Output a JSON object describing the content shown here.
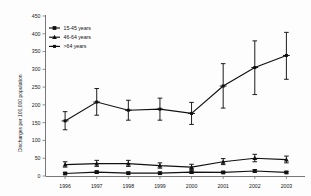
{
  "chart_data": {
    "type": "line",
    "title": "",
    "subtitle": "",
    "xlabel": "",
    "ylabel": "Discharges per 100,000 population",
    "categories": [
      "1996",
      "1997",
      "1998",
      "1999",
      "2000",
      "2001",
      "2002",
      "2003"
    ],
    "x": [
      1996,
      1997,
      1998,
      1999,
      2000,
      2001,
      2002,
      2003
    ],
    "ylim": [
      0,
      450
    ],
    "yticks": [
      0,
      50,
      100,
      150,
      200,
      250,
      300,
      350,
      400,
      450
    ],
    "ytick_labels": [
      "0",
      "50",
      "100",
      "150",
      "200",
      "250",
      "300",
      "350",
      "400",
      "450"
    ],
    "grid": false,
    "legend_position": "top-left",
    "error_bars": true,
    "error_bar_type": "95% confidence interval",
    "series": [
      {
        "name": "15-45 years",
        "marker": "square",
        "color": "#111111",
        "values": [
          7,
          11,
          8,
          8,
          11,
          10,
          14,
          10
        ],
        "err_low": [
          5,
          8,
          6,
          6,
          8,
          8,
          11,
          8
        ],
        "err_high": [
          10,
          14,
          11,
          11,
          14,
          13,
          18,
          13
        ]
      },
      {
        "name": "46-64 years",
        "marker": "triangle",
        "color": "#111111",
        "values": [
          32,
          35,
          35,
          29,
          25,
          40,
          50,
          46
        ],
        "err_low": [
          25,
          27,
          27,
          22,
          18,
          32,
          40,
          37
        ],
        "err_high": [
          40,
          44,
          44,
          37,
          33,
          49,
          61,
          56
        ]
      },
      {
        "name": ">64 years",
        "marker": "cross",
        "color": "#111111",
        "values": [
          155,
          208,
          185,
          188,
          176,
          253,
          305,
          339
        ],
        "err_low": [
          130,
          171,
          157,
          157,
          145,
          191,
          229,
          272
        ],
        "err_high": [
          181,
          246,
          213,
          219,
          207,
          316,
          380,
          404
        ]
      }
    ],
    "legend": [
      "15-45 years",
      "46-64 years",
      ">64 years"
    ]
  },
  "colors": {
    "series": "#111111",
    "axis": "#555555",
    "background": "#fdfdfd"
  }
}
